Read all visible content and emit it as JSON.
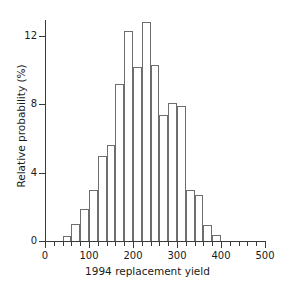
{
  "figure": {
    "background_color": "#ffffff",
    "axis_color": "#3a3a3a",
    "bar_edge_color": "#6e6e6e",
    "bar_fill_color": "#ffffff"
  },
  "chart_data": {
    "type": "bar",
    "title": "",
    "subtitle": "",
    "xlabel": "1994 replacement yield",
    "ylabel": "Relative probability (%)",
    "xlim": [
      0,
      500
    ],
    "ylim": [
      0,
      13.6
    ],
    "grid": false,
    "legend": null,
    "legend_position": "none",
    "bin_width": 20,
    "x_tick_labels": [
      "0",
      "100",
      "200",
      "300",
      "400",
      "500"
    ],
    "x_tick_values": [
      0,
      100,
      200,
      300,
      400,
      500
    ],
    "x_minor_tick_step": 20,
    "y_tick_labels": [
      "0",
      "4",
      "8",
      "12"
    ],
    "y_tick_values": [
      0,
      4,
      8,
      12
    ],
    "annotations": [],
    "bins": [
      {
        "x0": 40,
        "x1": 60,
        "center": 50,
        "value": 0.3
      },
      {
        "x0": 60,
        "x1": 80,
        "center": 70,
        "value": 1.0
      },
      {
        "x0": 80,
        "x1": 100,
        "center": 90,
        "value": 1.9
      },
      {
        "x0": 100,
        "x1": 120,
        "center": 110,
        "value": 3.0
      },
      {
        "x0": 120,
        "x1": 140,
        "center": 130,
        "value": 5.0
      },
      {
        "x0": 140,
        "x1": 160,
        "center": 150,
        "value": 5.6
      },
      {
        "x0": 160,
        "x1": 180,
        "center": 170,
        "value": 9.2
      },
      {
        "x0": 180,
        "x1": 200,
        "center": 190,
        "value": 12.3
      },
      {
        "x0": 200,
        "x1": 220,
        "center": 210,
        "value": 10.2
      },
      {
        "x0": 220,
        "x1": 240,
        "center": 230,
        "value": 12.8
      },
      {
        "x0": 240,
        "x1": 260,
        "center": 250,
        "value": 10.3
      },
      {
        "x0": 260,
        "x1": 280,
        "center": 270,
        "value": 7.4
      },
      {
        "x0": 280,
        "x1": 300,
        "center": 290,
        "value": 8.1
      },
      {
        "x0": 300,
        "x1": 320,
        "center": 310,
        "value": 7.9
      },
      {
        "x0": 320,
        "x1": 340,
        "center": 330,
        "value": 3.0
      },
      {
        "x0": 340,
        "x1": 360,
        "center": 350,
        "value": 2.7
      },
      {
        "x0": 360,
        "x1": 380,
        "center": 370,
        "value": 0.95
      },
      {
        "x0": 380,
        "x1": 400,
        "center": 390,
        "value": 0.35
      }
    ]
  }
}
